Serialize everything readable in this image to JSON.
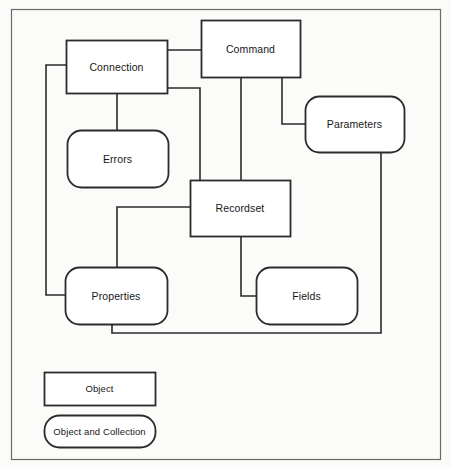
{
  "diagram": {
    "background_color": "#fbfbfa",
    "stroke_color": "#2b2b2b",
    "text_color": "#171717",
    "frame": {
      "x": 11,
      "y": 9,
      "width": 429,
      "height": 450
    },
    "nodes": [
      {
        "id": "connection",
        "label": "Connection",
        "shape": "rect",
        "x": 66,
        "y": 40,
        "width": 101,
        "height": 53
      },
      {
        "id": "command",
        "label": "Command",
        "shape": "rect",
        "x": 201,
        "y": 20,
        "width": 99,
        "height": 57
      },
      {
        "id": "parameters",
        "label": "Parameters",
        "shape": "rounded",
        "x": 305,
        "y": 96,
        "width": 99,
        "height": 56
      },
      {
        "id": "errors",
        "label": "Errors",
        "shape": "rounded",
        "x": 67,
        "y": 130,
        "width": 101,
        "height": 57
      },
      {
        "id": "recordset",
        "label": "Recordset",
        "shape": "rect",
        "x": 190,
        "y": 180,
        "width": 100,
        "height": 56
      },
      {
        "id": "properties",
        "label": "Properties",
        "shape": "rounded",
        "x": 65,
        "y": 267,
        "width": 102,
        "height": 57
      },
      {
        "id": "fields",
        "label": "Fields",
        "shape": "rounded",
        "x": 256,
        "y": 267,
        "width": 101,
        "height": 57
      }
    ],
    "connectors": [
      {
        "id": "connection-command",
        "from": "connection",
        "to": "command",
        "path": "M 167 50 L 201 50"
      },
      {
        "id": "connection-errors",
        "from": "connection",
        "to": "errors",
        "path": "M 117 93 L 117 130"
      },
      {
        "id": "connection-properties",
        "from": "connection",
        "to": "properties",
        "path": "M 66 65 L 46 65 L 46 295 L 65 295"
      },
      {
        "id": "connection-recordset",
        "from": "connection",
        "to": "recordset",
        "path": "M 167 88 L 200 88 L 200 207 L 190 207"
      },
      {
        "id": "command-recordset",
        "from": "command",
        "to": "recordset",
        "path": "M 241 77 L 241 180"
      },
      {
        "id": "command-parameters",
        "from": "command",
        "to": "parameters",
        "path": "M 282 77 L 282 124 L 305 124"
      },
      {
        "id": "recordset-properties",
        "from": "recordset",
        "to": "properties",
        "path": "M 190 207 L 117 207 L 117 267"
      },
      {
        "id": "recordset-fields",
        "from": "recordset",
        "to": "fields",
        "path": "M 241 236 L 241 296 L 256 296"
      },
      {
        "id": "properties-parameters",
        "from": "properties",
        "to": "parameters",
        "path": "M 112 324 L 112 333 L 381 333 L 381 152"
      }
    ]
  },
  "legend": {
    "items": [
      {
        "id": "legend-object",
        "label": "Object",
        "shape": "rect",
        "x": 44,
        "y": 372,
        "width": 111,
        "height": 33
      },
      {
        "id": "legend-collection",
        "label": "Object and Collection",
        "shape": "rounded",
        "x": 44,
        "y": 415,
        "width": 111,
        "height": 32
      }
    ]
  }
}
